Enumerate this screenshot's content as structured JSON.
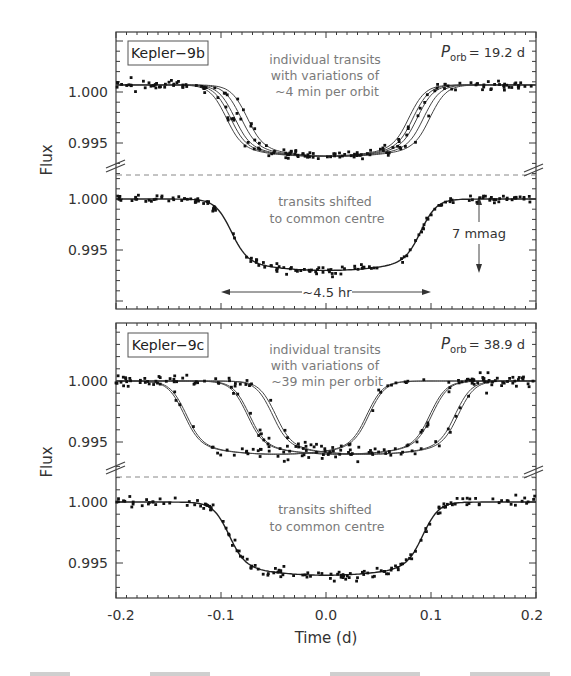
{
  "figure": {
    "xlabel": "Time (d)",
    "ylabel": "Flux",
    "x_ticks": [
      "-0.2",
      "-0.1",
      "0.0",
      "0.1",
      "0.2"
    ],
    "y_ticks": [
      "1.000",
      "0.995"
    ]
  },
  "panels": {
    "kepler9b": {
      "label": "Kepler−9b",
      "period_symbol": "P",
      "period_subscript": "orb",
      "period_value": "= 19.2 d",
      "top_annotation": [
        "individual transits",
        "with variations of",
        "~4 min per orbit"
      ],
      "bottom_annotation": [
        "transits shifted",
        "to common centre"
      ],
      "duration_label": "~4.5 hr",
      "depth_label": "7 mmag"
    },
    "kepler9c": {
      "label": "Kepler−9c",
      "period_symbol": "P",
      "period_subscript": "orb",
      "period_value": "= 38.9 d",
      "top_annotation": [
        "individual transits",
        "with variations of",
        "~39 min per orbit"
      ],
      "bottom_annotation": [
        "transits shifted",
        "to common centre"
      ]
    }
  },
  "chart_data": [
    {
      "type": "scatter",
      "title": "Kepler-9b individual transits",
      "xlabel": "Time (d)",
      "ylabel": "Flux",
      "xlim": [
        -0.2,
        0.2
      ],
      "ylim": [
        0.9922,
        1.0045
      ],
      "annotations": [
        "Kepler-9b",
        "P_orb = 19.2 d",
        "individual transits with variations of ~4 min per orbit"
      ],
      "series": [
        {
          "name": "transit 1",
          "center": -0.008,
          "depth": 0.007,
          "half_duration": 0.088
        },
        {
          "name": "transit 2",
          "center": -0.004,
          "depth": 0.007,
          "half_duration": 0.088
        },
        {
          "name": "transit 3",
          "center": 0.0,
          "depth": 0.007,
          "half_duration": 0.088
        },
        {
          "name": "transit 4",
          "center": 0.006,
          "depth": 0.007,
          "half_duration": 0.088
        },
        {
          "name": "transit 5",
          "center": 0.012,
          "depth": 0.007,
          "half_duration": 0.088
        }
      ],
      "baseline": 1.0007
    },
    {
      "type": "scatter",
      "title": "Kepler-9b transits shifted to common centre",
      "xlabel": "Time (d)",
      "ylabel": "Flux",
      "xlim": [
        -0.2,
        0.2
      ],
      "ylim": [
        0.9918,
        1.002
      ],
      "annotations": [
        "transits shifted to common centre",
        "~4.5 hr",
        "7 mmag"
      ],
      "series": [
        {
          "name": "stacked",
          "center": 0.0,
          "depth": 0.007,
          "half_duration": 0.091
        }
      ],
      "baseline": 1.0
    },
    {
      "type": "scatter",
      "title": "Kepler-9c individual transits",
      "xlabel": "Time (d)",
      "ylabel": "Flux",
      "xlim": [
        -0.2,
        0.2
      ],
      "ylim": [
        0.9928,
        1.0045
      ],
      "annotations": [
        "Kepler-9c",
        "P_orb = 38.9 d",
        "individual transits with variations of ~39 min per orbit"
      ],
      "series": [
        {
          "name": "transit 1",
          "center": -0.048,
          "depth": 0.006,
          "half_duration": 0.088
        },
        {
          "name": "transit 2",
          "center": -0.046,
          "depth": 0.006,
          "half_duration": 0.088
        },
        {
          "name": "transit 3",
          "center": 0.012,
          "depth": 0.006,
          "half_duration": 0.088
        },
        {
          "name": "transit 4",
          "center": 0.014,
          "depth": 0.006,
          "half_duration": 0.088
        },
        {
          "name": "transit 5",
          "center": 0.036,
          "depth": 0.006,
          "half_duration": 0.088
        },
        {
          "name": "transit 6",
          "center": 0.039,
          "depth": 0.006,
          "half_duration": 0.088
        }
      ],
      "baseline": 1.0
    },
    {
      "type": "scatter",
      "title": "Kepler-9c transits shifted to common centre",
      "xlabel": "Time (d)",
      "ylabel": "Flux",
      "xlim": [
        -0.2,
        0.2
      ],
      "ylim": [
        0.9922,
        1.0015
      ],
      "annotations": [
        "transits shifted to common centre"
      ],
      "series": [
        {
          "name": "stacked",
          "center": 0.0,
          "depth": 0.006,
          "half_duration": 0.093
        }
      ],
      "baseline": 1.0
    }
  ]
}
